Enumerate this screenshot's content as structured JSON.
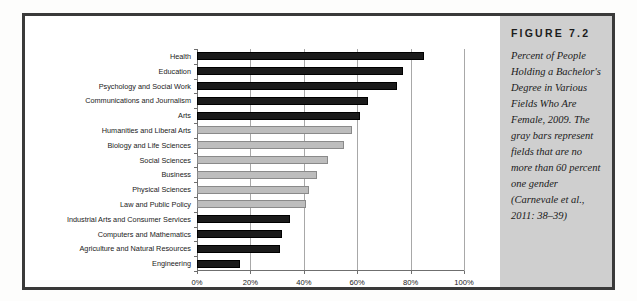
{
  "figure": {
    "title": "FIGURE 7.2",
    "caption": "Percent of People Holding a Bachelor's Degree in Various Fields Who Are Female, 2009. The gray bars represent fields that are no more than 60 percent one gender (Carnevale et al., 2011: 38–39)"
  },
  "colors": {
    "dark_bar": "#1b1b1b",
    "gray_bar": "#bdbdbd",
    "gray_bar_border": "#8a8a8a",
    "caption_panel": "#cfcfcf",
    "frame": "#3a3a3a",
    "gridline": "#a8a8a8",
    "plot_background": "#ffffff"
  },
  "chart_data": {
    "type": "bar",
    "orientation": "horizontal",
    "title": "Percent of People Holding a Bachelor's Degree in Various Fields Who Are Female, 2009",
    "xlabel": "",
    "ylabel": "",
    "xlim": [
      0,
      100
    ],
    "grid": true,
    "legend": "none",
    "tick_labels": [
      "0%",
      "20%",
      "40%",
      "60%",
      "80%",
      "100%"
    ],
    "ticks": [
      0,
      20,
      40,
      60,
      80,
      100
    ],
    "categories": [
      "Health",
      "Education",
      "Psychology and Social Work",
      "Communications and Journalism",
      "Arts",
      "Humanities and Liberal Arts",
      "Biology and Life Sciences",
      "Social Sciences",
      "Business",
      "Physical Sciences",
      "Law and Public Policy",
      "Industrial Arts and Consumer Services",
      "Computers and Mathematics",
      "Agriculture and Natural Resources",
      "Engineering"
    ],
    "values": [
      85,
      77,
      75,
      64,
      61,
      58,
      55,
      49,
      45,
      42,
      41,
      35,
      32,
      31,
      16
    ],
    "bar_colors": [
      "dark",
      "dark",
      "dark",
      "dark",
      "dark",
      "gray",
      "gray",
      "gray",
      "gray",
      "gray",
      "gray",
      "dark",
      "dark",
      "dark",
      "dark"
    ]
  }
}
